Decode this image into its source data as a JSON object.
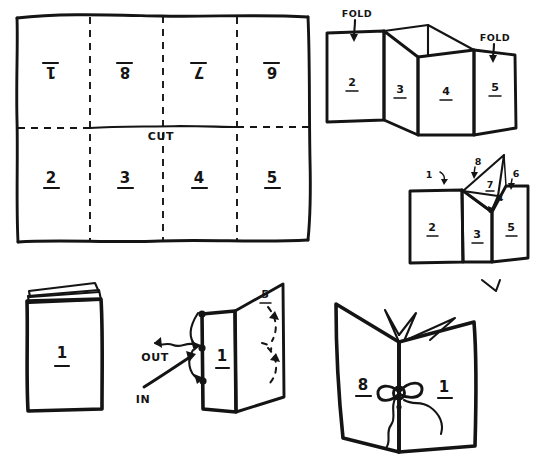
{
  "document": {
    "title": "Eight-Page Folded Booklet - Fold, Cut and Bind Instructions",
    "style": "hand-drawn pen sketch on white paper",
    "ink_color": "#141414",
    "paper_color": "#ffffff"
  },
  "panels": {
    "sheet": {
      "name": "flat-sheet-layout",
      "caption_cut": "CUT",
      "top_row": {
        "orientation": "upside-down",
        "cells": [
          "1",
          "8",
          "7",
          "6"
        ]
      },
      "bottom_row": {
        "orientation": "upright",
        "cells": [
          "2",
          "3",
          "4",
          "5"
        ]
      },
      "fold_lines": "dashed",
      "cut_line": "solid"
    },
    "accordion": {
      "name": "accordion-fold-step",
      "fold_label_left": "FOLD",
      "fold_label_right": "FOLD",
      "panel_labels": [
        "2",
        "3",
        "4",
        "5"
      ]
    },
    "collapse": {
      "name": "collapse-step",
      "panel_labels": [
        "2",
        "3",
        "5"
      ],
      "callouts": [
        "1",
        "8",
        "7",
        "4",
        "6"
      ]
    },
    "closed_book": {
      "name": "closed-booklet",
      "cover_label": "1"
    },
    "threading": {
      "name": "thread-binding-step",
      "front_label": "1",
      "back_label": "5",
      "arrow_out": "OUT",
      "arrow_in": "IN",
      "hole_count": 3
    },
    "finished": {
      "name": "finished-bound-booklet",
      "left_page_label": "8",
      "right_page_label": "1",
      "binding": "bow-knot-tie"
    }
  }
}
